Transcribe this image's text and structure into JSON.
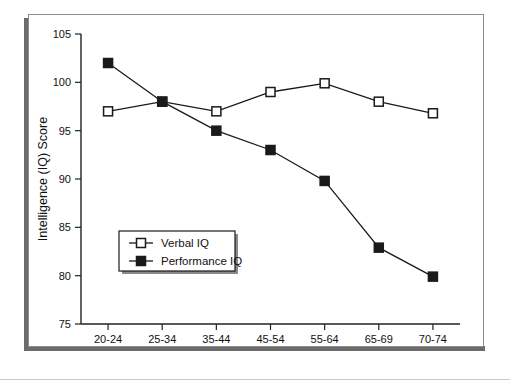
{
  "figure": {
    "background_color": "#ffffff",
    "frame_color": "#8d8d8d",
    "shadow_color": "#6b6b6b"
  },
  "chart_data": {
    "type": "line",
    "title": "",
    "xlabel": "Age",
    "ylabel": "Intelligence (IQ) Score",
    "categories": [
      "20-24",
      "25-34",
      "35-44",
      "45-54",
      "55-64",
      "65-69",
      "70-74"
    ],
    "ylim": [
      75,
      105
    ],
    "yticks": [
      75,
      80,
      85,
      90,
      95,
      100,
      105
    ],
    "ytick_labels": [
      "75",
      "80",
      "85",
      "90",
      "95",
      "100",
      "105"
    ],
    "grid": false,
    "legend_position": "lower-left-inside",
    "series": [
      {
        "name": "Verbal IQ",
        "marker": "open-square",
        "color": "#1a1a1a",
        "values": [
          97.0,
          98.0,
          97.0,
          99.0,
          99.9,
          98.0,
          96.8
        ]
      },
      {
        "name": "Performance IQ",
        "marker": "filled-square",
        "color": "#1a1a1a",
        "values": [
          102.0,
          98.0,
          95.0,
          93.0,
          89.8,
          82.9,
          79.9
        ]
      }
    ]
  }
}
